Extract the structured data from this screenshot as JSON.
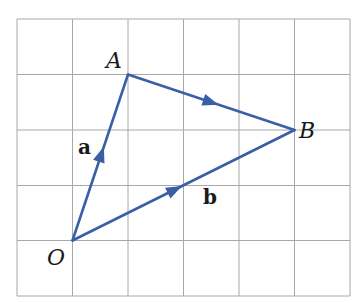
{
  "diagram": {
    "type": "vector-grid-diagram",
    "grid": {
      "columns": 6,
      "rows": 5,
      "origin_px": [
        17,
        19
      ],
      "cell_px": 55.5,
      "line_color": "#a8a8a8"
    },
    "vector_color": "#3b5fa6",
    "points": [
      {
        "id": "O",
        "label": "O",
        "grid": [
          1,
          4
        ]
      },
      {
        "id": "A",
        "label": "A",
        "grid": [
          2,
          1
        ]
      },
      {
        "id": "B",
        "label": "B",
        "grid": [
          5,
          2
        ]
      }
    ],
    "segments": [
      {
        "from": "O",
        "to": "A",
        "label": "a",
        "arrow": true
      },
      {
        "from": "A",
        "to": "B",
        "label": "",
        "arrow": true
      },
      {
        "from": "O",
        "to": "B",
        "label": "b",
        "arrow": true
      }
    ],
    "labels": {
      "point_o": "O",
      "point_a": "A",
      "point_b": "B",
      "vector_a": "a",
      "vector_b": "b"
    }
  }
}
